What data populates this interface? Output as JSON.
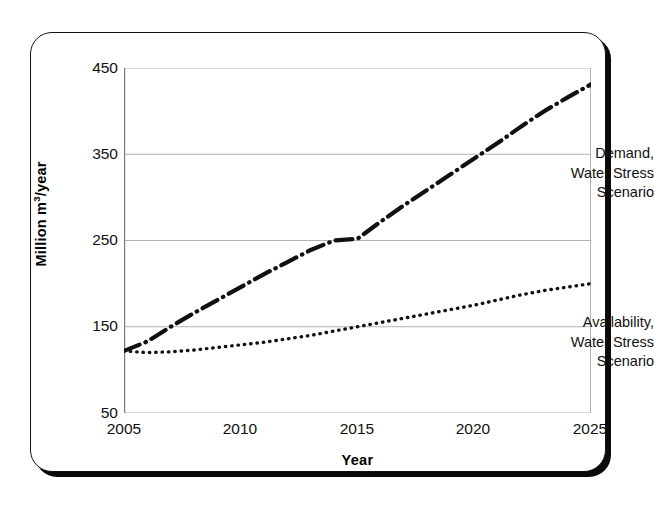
{
  "figure": {
    "frame": {
      "style": "rounded-rectangle-with-shadow",
      "border_color": "#111111",
      "shadow_color": "#0a0a0a"
    }
  },
  "chart_data": {
    "type": "line",
    "title": "",
    "xlabel": "Year",
    "ylabel": "Million m3/year",
    "ylabel_parts": {
      "prefix": "Million m",
      "superscript": "3",
      "suffix": "/year"
    },
    "xlim": [
      2005,
      2025
    ],
    "ylim": [
      50,
      450
    ],
    "xticks": [
      2005,
      2010,
      2015,
      2020,
      2025
    ],
    "yticks": [
      450,
      350,
      250,
      150,
      50
    ],
    "xtick_labels": [
      "2005",
      "2010",
      "2015",
      "2020",
      "2025"
    ],
    "ytick_labels": [
      "450",
      "350",
      "250",
      "150",
      "50"
    ],
    "grid": "horizontal",
    "grid_color": "#b3b3b3",
    "legend": "none",
    "x": [
      2005,
      2006,
      2007,
      2008,
      2009,
      2010,
      2011,
      2012,
      2013,
      2014,
      2015,
      2016,
      2017,
      2018,
      2019,
      2020,
      2021,
      2022,
      2023,
      2024,
      2025
    ],
    "series": [
      {
        "name": "Demand, Water Stress Scenario",
        "style": "dash-dot",
        "color": "#111111",
        "width": 4.2,
        "values": [
          122,
          133,
          150,
          166,
          181,
          196,
          211,
          225,
          239,
          250,
          252,
          272,
          291,
          309,
          327,
          345,
          363,
          382,
          400,
          416,
          431
        ]
      },
      {
        "name": "Availability, Water Stress Scenario",
        "style": "dotted",
        "color": "#111111",
        "width": 3.4,
        "values": [
          122,
          120,
          121,
          123,
          126,
          129,
          132,
          136,
          140,
          145,
          150,
          155,
          160,
          165,
          170,
          175,
          181,
          187,
          192,
          196,
          200
        ]
      }
    ],
    "annotations": [
      {
        "name": "demand-label",
        "lines": [
          "Demand,",
          "Water Stress",
          "Scenario"
        ],
        "x": 2019.5,
        "y": 412
      },
      {
        "name": "availability-label",
        "lines": [
          "Availability,",
          "Water Stress",
          "Scenario"
        ],
        "x": 2019.5,
        "y": 218
      }
    ]
  }
}
